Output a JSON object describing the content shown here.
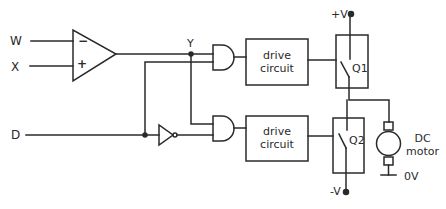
{
  "diagram": {
    "type": "circuit-schematic",
    "colors": {
      "stroke": "#2a2a2a",
      "background": "#ffffff"
    },
    "inputs": {
      "w": "W",
      "x": "X",
      "d": "D"
    },
    "comparator": {
      "minus": "−",
      "plus": "+"
    },
    "node_y": "Y",
    "drive_upper": {
      "line1": "drive",
      "line2": "circuit"
    },
    "drive_lower": {
      "line1": "drive",
      "line2": "circuit"
    },
    "switch_upper": "Q1",
    "switch_lower": "Q2",
    "supply_pos": "+V",
    "supply_neg": "-V",
    "motor": {
      "line1": "DC",
      "line2": "motor"
    },
    "ground": "0V"
  }
}
